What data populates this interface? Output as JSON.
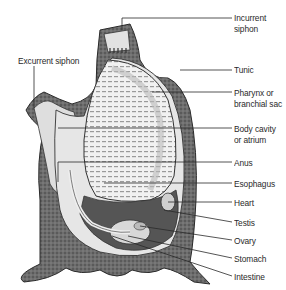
{
  "figure": {
    "labels": {
      "incurrent_siphon": [
        "Incurrent",
        "siphon"
      ],
      "excurrent_siphon": "Excurrent siphon",
      "tunic": "Tunic",
      "pharynx": [
        "Pharynx or",
        "branchial sac"
      ],
      "body_cavity": [
        "Body cavity",
        "or atrium"
      ],
      "anus": "Anus",
      "esophagus": "Esophagus",
      "heart": "Heart",
      "testis": "Testis",
      "ovary": "Ovary",
      "stomach": "Stomach",
      "intestine": "Intestine"
    }
  },
  "colors": {
    "ink": "#2a2a2a",
    "tunic_fill": "#6b6b6b",
    "inner_fill": "#d9d9d9",
    "cavity_fill": "#ececec",
    "dark_fill": "#4a4a4a"
  }
}
